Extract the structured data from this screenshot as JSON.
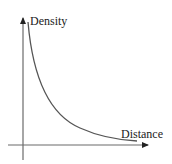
{
  "diagram": {
    "type": "decay-curve",
    "y_axis_label": "Density",
    "x_axis_label": "Distance",
    "colors": {
      "axis": "#6b6b6b",
      "curve": "#555555",
      "text": "#222222"
    }
  }
}
